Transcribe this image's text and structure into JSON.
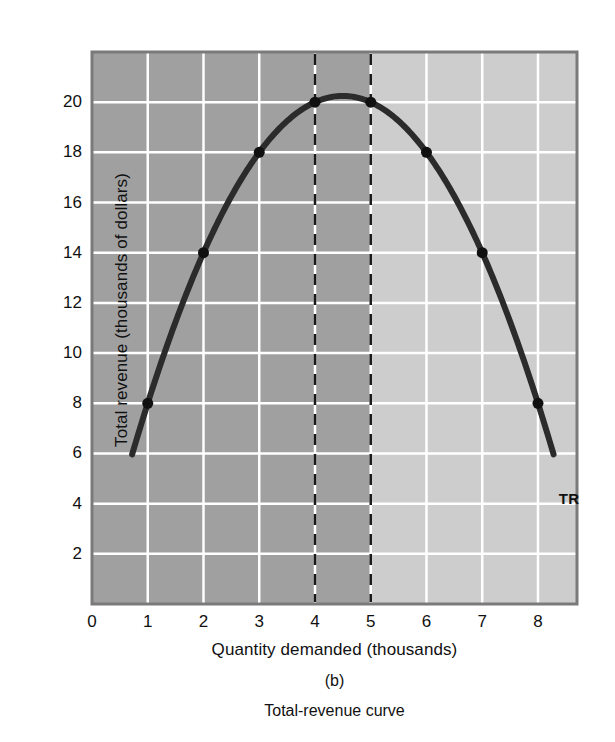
{
  "chart_data": {
    "type": "line",
    "title": "Total-revenue curve",
    "panel_label": "(b)",
    "xlabel": "Quantity demanded (thousands)",
    "ylabel": "Total revenue (thousands of dollars)",
    "xlim": [
      0,
      8.7
    ],
    "ylim": [
      0,
      22
    ],
    "xticks": [
      "0",
      "1",
      "2",
      "3",
      "4",
      "5",
      "6",
      "7",
      "8"
    ],
    "xtick_values": [
      0,
      1,
      2,
      3,
      4,
      5,
      6,
      7,
      8
    ],
    "yticks": [
      "2",
      "4",
      "6",
      "8",
      "10",
      "12",
      "14",
      "16",
      "18",
      "20"
    ],
    "ytick_values": [
      2,
      4,
      6,
      8,
      10,
      12,
      14,
      16,
      18,
      20
    ],
    "grid": true,
    "legend_position": "inline-right",
    "series": [
      {
        "name": "TR",
        "label": "TR",
        "x": [
          1,
          2,
          3,
          4,
          5,
          6,
          7,
          8
        ],
        "values": [
          8,
          14,
          18,
          20,
          20,
          18,
          14,
          8
        ],
        "markers": true,
        "curve_start": {
          "x": 0.72,
          "y": 5.0
        },
        "curve_end": {
          "x": 8.28,
          "y": 5.0
        },
        "vertex": {
          "x": 4.5,
          "y": 20.25
        }
      }
    ],
    "annotations": [
      {
        "type": "vline",
        "x": 4,
        "style": "dashed"
      },
      {
        "type": "vline",
        "x": 5,
        "style": "dashed"
      }
    ],
    "shaded_regions": [
      {
        "from_x": 0,
        "to_x": 5,
        "color": "#a0a0a0",
        "name": "elastic-region"
      },
      {
        "from_x": 5,
        "to_x": 8.7,
        "color": "#cdcdcd",
        "name": "inelastic-region"
      }
    ],
    "colors": {
      "curve": "#2b2b2b",
      "gridline": "#ffffff",
      "dashline": "#1a1a1a",
      "marker": "#101010",
      "plot_border": "#7a7a7a",
      "text": "#111111",
      "page_background": "#ffffff"
    }
  }
}
